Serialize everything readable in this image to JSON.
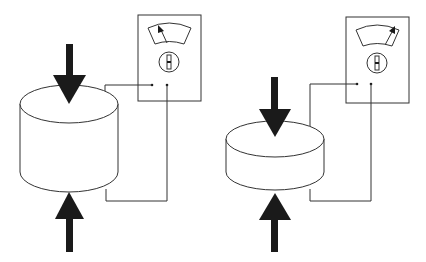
{
  "diagram": {
    "colors": {
      "stroke": "#333333",
      "arrow": "#1a1a1a",
      "background": "#ffffff"
    },
    "panels": [
      {
        "id": "left",
        "specimen": "tall cylinder",
        "meter_needle": "left"
      },
      {
        "id": "right",
        "specimen": "short compressed cylinder",
        "meter_needle": "right"
      }
    ]
  }
}
